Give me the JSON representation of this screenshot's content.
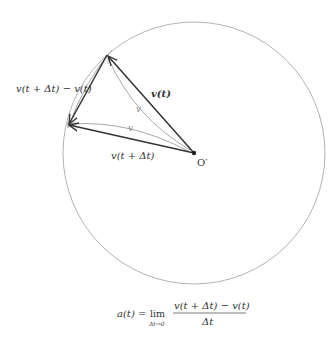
{
  "diagram": {
    "type": "velocity-vector-hodograph",
    "colors": {
      "circle": "#b0b0b0",
      "vector": "#333333",
      "curve": "#a8a8a8",
      "text": "#333333",
      "background": "#ffffff"
    },
    "circle": {
      "cx": 194,
      "cy": 153,
      "r": 131
    },
    "origin": {
      "x": 194,
      "y": 153,
      "label": "O′"
    },
    "points": {
      "v_t_tip": {
        "x": 107,
        "y": 55
      },
      "v_t_dt_tip": {
        "x": 68,
        "y": 125
      }
    },
    "labels": {
      "v_t": "v(t)",
      "v_t_dt": "v(t + Δt)",
      "difference": "v(t + Δt) − v(t)",
      "speed_upper": "v",
      "speed_lower": "v"
    }
  },
  "formula": {
    "lhs": "a(t) =",
    "lim": "lim",
    "lim_sub": "Δt→0",
    "numerator": "v(t + Δt) − v(t)",
    "denominator": "Δt"
  }
}
